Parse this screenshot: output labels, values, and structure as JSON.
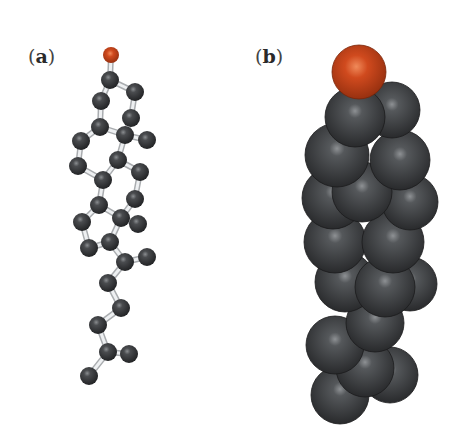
{
  "panels": [
    {
      "id": "a",
      "label_open": "(",
      "label_letter": "a",
      "label_close": ")",
      "style": "ball-and-stick"
    },
    {
      "id": "b",
      "label_open": "(",
      "label_letter": "b",
      "label_close": ")",
      "style": "space-filling"
    }
  ],
  "colors": {
    "carbon": "#3a3c3e",
    "oxygen": "#c8431c",
    "bond": "#d6d8da",
    "background": "#ffffff"
  },
  "ball_stick": {
    "atoms": [
      {
        "x": 111,
        "y": 55,
        "el": "O"
      },
      {
        "x": 110,
        "y": 80,
        "el": "C"
      },
      {
        "x": 135,
        "y": 92,
        "el": "C"
      },
      {
        "x": 101,
        "y": 101,
        "el": "C"
      },
      {
        "x": 131,
        "y": 118,
        "el": "C"
      },
      {
        "x": 100,
        "y": 127,
        "el": "C"
      },
      {
        "x": 125,
        "y": 135,
        "el": "C"
      },
      {
        "x": 147,
        "y": 140,
        "el": "C"
      },
      {
        "x": 81,
        "y": 141,
        "el": "C"
      },
      {
        "x": 118,
        "y": 160,
        "el": "C"
      },
      {
        "x": 78,
        "y": 166,
        "el": "C"
      },
      {
        "x": 103,
        "y": 180,
        "el": "C"
      },
      {
        "x": 140,
        "y": 172,
        "el": "C"
      },
      {
        "x": 99,
        "y": 205,
        "el": "C"
      },
      {
        "x": 135,
        "y": 199,
        "el": "C"
      },
      {
        "x": 82,
        "y": 222,
        "el": "C"
      },
      {
        "x": 121,
        "y": 218,
        "el": "C"
      },
      {
        "x": 138,
        "y": 224,
        "el": "C"
      },
      {
        "x": 89,
        "y": 248,
        "el": "C"
      },
      {
        "x": 110,
        "y": 242,
        "el": "C"
      },
      {
        "x": 125,
        "y": 262,
        "el": "C"
      },
      {
        "x": 147,
        "y": 257,
        "el": "C"
      },
      {
        "x": 108,
        "y": 283,
        "el": "C"
      },
      {
        "x": 121,
        "y": 308,
        "el": "C"
      },
      {
        "x": 98,
        "y": 325,
        "el": "C"
      },
      {
        "x": 108,
        "y": 352,
        "el": "C"
      },
      {
        "x": 129,
        "y": 354,
        "el": "C"
      },
      {
        "x": 89,
        "y": 376,
        "el": "C"
      }
    ],
    "bonds": [
      [
        0,
        1
      ],
      [
        1,
        2
      ],
      [
        1,
        3
      ],
      [
        2,
        4
      ],
      [
        3,
        5
      ],
      [
        4,
        6
      ],
      [
        5,
        6
      ],
      [
        6,
        7
      ],
      [
        5,
        8
      ],
      [
        6,
        9
      ],
      [
        8,
        10
      ],
      [
        10,
        11
      ],
      [
        9,
        11
      ],
      [
        9,
        12
      ],
      [
        11,
        13
      ],
      [
        12,
        14
      ],
      [
        13,
        16
      ],
      [
        14,
        16
      ],
      [
        16,
        17
      ],
      [
        13,
        15
      ],
      [
        15,
        18
      ],
      [
        18,
        19
      ],
      [
        16,
        19
      ],
      [
        19,
        20
      ],
      [
        20,
        21
      ],
      [
        20,
        22
      ],
      [
        22,
        23
      ],
      [
        23,
        24
      ],
      [
        24,
        25
      ],
      [
        25,
        26
      ],
      [
        25,
        27
      ]
    ]
  },
  "space_fill": {
    "spheres": [
      {
        "x": 340,
        "y": 395,
        "r": 29,
        "el": "C"
      },
      {
        "x": 390,
        "y": 375,
        "r": 28,
        "el": "C"
      },
      {
        "x": 365,
        "y": 368,
        "r": 29,
        "el": "C"
      },
      {
        "x": 335,
        "y": 345,
        "r": 29,
        "el": "C"
      },
      {
        "x": 375,
        "y": 323,
        "r": 29,
        "el": "C"
      },
      {
        "x": 410,
        "y": 284,
        "r": 27,
        "el": "C"
      },
      {
        "x": 345,
        "y": 282,
        "r": 30,
        "el": "C"
      },
      {
        "x": 385,
        "y": 287,
        "r": 30,
        "el": "C"
      },
      {
        "x": 335,
        "y": 242,
        "r": 31,
        "el": "C"
      },
      {
        "x": 393,
        "y": 242,
        "r": 31,
        "el": "C"
      },
      {
        "x": 410,
        "y": 202,
        "r": 28,
        "el": "C"
      },
      {
        "x": 333,
        "y": 198,
        "r": 31,
        "el": "C"
      },
      {
        "x": 362,
        "y": 192,
        "r": 30,
        "el": "C"
      },
      {
        "x": 400,
        "y": 160,
        "r": 30,
        "el": "C"
      },
      {
        "x": 337,
        "y": 155,
        "r": 32,
        "el": "C"
      },
      {
        "x": 392,
        "y": 110,
        "r": 28,
        "el": "C"
      },
      {
        "x": 355,
        "y": 117,
        "r": 30,
        "el": "C"
      },
      {
        "x": 359,
        "y": 72,
        "r": 27,
        "el": "O"
      }
    ]
  }
}
